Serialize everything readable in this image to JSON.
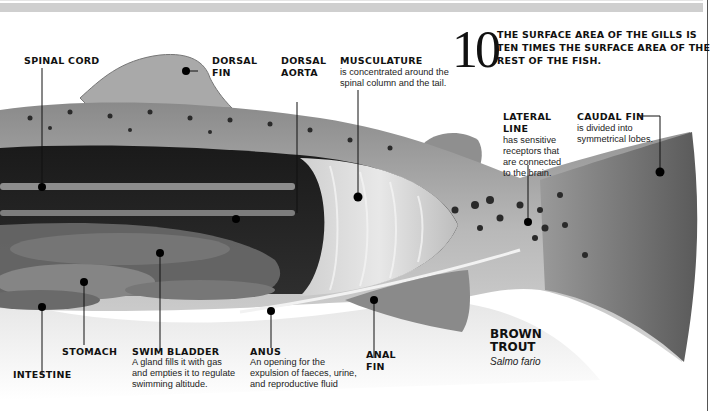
{
  "diagram": {
    "title": "BROWN TROUT",
    "subtitle": "Salmo fario",
    "fact": {
      "number": "10",
      "text": "THE SURFACE AREA OF THE GILLS IS TEN TIMES THE SURFACE AREA OF THE REST OF THE FISH."
    },
    "labels": {
      "spinal_cord": {
        "title": "SPINAL CORD"
      },
      "dorsal_fin": {
        "title_line1": "DORSAL",
        "title_line2": "FIN"
      },
      "dorsal_aorta": {
        "title_line1": "DORSAL",
        "title_line2": "AORTA"
      },
      "musculature": {
        "title": "MUSCULATURE",
        "desc_line1": "is concentrated around the",
        "desc_line2": "spinal column and the tail."
      },
      "lateral_line": {
        "title_line1": "LATERAL",
        "title_line2": "LINE",
        "desc_line1": "has sensitive",
        "desc_line2": "receptors that",
        "desc_line3": "are connected",
        "desc_line4": "to the brain."
      },
      "caudal_fin": {
        "title": "CAUDAL FIN",
        "desc_line1": "is divided into",
        "desc_line2": "symmetrical lobes."
      },
      "intestine": {
        "title": "INTESTINE"
      },
      "stomach": {
        "title": "STOMACH"
      },
      "swim_bladder": {
        "title": "SWIM BLADDER",
        "desc_line1": "A gland fills it with gas",
        "desc_line2": "and empties it to regulate",
        "desc_line3": "swimming altitude."
      },
      "anus": {
        "title": "ANUS",
        "desc_line1": "An opening for the",
        "desc_line2": "expulsion of faeces, urine,",
        "desc_line3": "and reproductive fluid"
      },
      "anal_fin": {
        "title_line1": "ANAL",
        "title_line2": "FIN"
      }
    },
    "colors": {
      "background": "#ffffff",
      "text": "#111111",
      "marker": "#000000",
      "top_bar": "#cfcfcf"
    }
  }
}
